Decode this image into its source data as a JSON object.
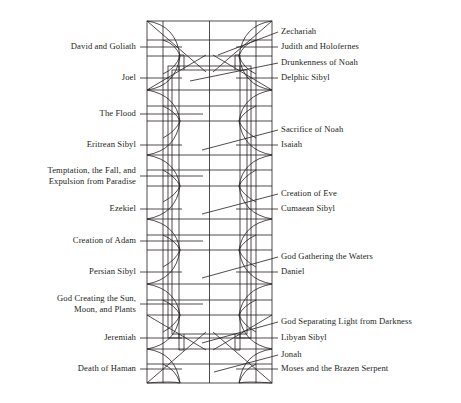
{
  "figure": {
    "type": "architectural-plan-diagram",
    "background_color": "#ffffff",
    "line_color": "#231f20",
    "label_color": "#231f20"
  },
  "labels": {
    "left": [
      {
        "id": "david-and-goliath",
        "text": "David and Goliath",
        "x": 140,
        "y": 47,
        "leader_to_x": 178,
        "leader_to_y": 47,
        "multiline": false
      },
      {
        "id": "joel",
        "text": "Joel",
        "x": 140,
        "y": 78,
        "leader_to_x": 178,
        "leader_to_y": 78,
        "multiline": false
      },
      {
        "id": "the-flood",
        "text": "The Flood",
        "x": 140,
        "y": 114,
        "leader_to_x": 200,
        "leader_to_y": 114,
        "multiline": false
      },
      {
        "id": "eritrean-sibyl",
        "text": "Eritrean Sibyl",
        "x": 140,
        "y": 145,
        "leader_to_x": 178,
        "leader_to_y": 145,
        "multiline": false
      },
      {
        "id": "temptation-fall-expulsion",
        "text": "Temptation, the Fall, and",
        "text2": "Expulsion from Paradise",
        "x": 140,
        "y": 176,
        "leader_to_x": 200,
        "leader_to_y": 176,
        "multiline": true
      },
      {
        "id": "ezekiel",
        "text": "Ezekiel",
        "x": 140,
        "y": 209,
        "leader_to_x": 178,
        "leader_to_y": 209,
        "multiline": false
      },
      {
        "id": "creation-of-adam",
        "text": "Creation of Adam",
        "x": 140,
        "y": 241,
        "leader_to_x": 200,
        "leader_to_y": 241,
        "multiline": false
      },
      {
        "id": "persian-sibyl",
        "text": "Persian Sibyl",
        "x": 140,
        "y": 272,
        "leader_to_x": 178,
        "leader_to_y": 272,
        "multiline": false
      },
      {
        "id": "god-creating-sun-moon-plants",
        "text": "God Creating the Sun,",
        "text2": "Moon, and Plants",
        "x": 140,
        "y": 304,
        "leader_to_x": 200,
        "leader_to_y": 304,
        "multiline": true
      },
      {
        "id": "jeremiah",
        "text": "Jeremiah",
        "x": 140,
        "y": 338,
        "leader_to_x": 178,
        "leader_to_y": 338,
        "multiline": false
      },
      {
        "id": "death-of-haman",
        "text": "Death of Haman",
        "x": 140,
        "y": 369,
        "leader_to_x": 178,
        "leader_to_y": 369,
        "multiline": false
      }
    ],
    "right": [
      {
        "id": "zechariah",
        "text": "Zechariah",
        "x": 280,
        "y": 32,
        "leader_to_x": 243,
        "leader_to_y": 44,
        "multiline": false
      },
      {
        "id": "judith-and-holofernes",
        "text": "Judith and Holofernes",
        "x": 280,
        "y": 47,
        "leader_to_x": 240,
        "leader_to_y": 47,
        "multiline": false
      },
      {
        "id": "drunkenness-of-noah",
        "text": "Drunkenness of Noah",
        "x": 280,
        "y": 63,
        "leader_to_x": 205,
        "leader_to_y": 76,
        "multiline": false
      },
      {
        "id": "delphic-sibyl",
        "text": "Delphic Sibyl",
        "x": 280,
        "y": 78,
        "leader_to_x": 240,
        "leader_to_y": 78,
        "multiline": false
      },
      {
        "id": "sacrifice-of-noah",
        "text": "Sacrifice of Noah",
        "x": 280,
        "y": 130,
        "leader_to_x": 205,
        "leader_to_y": 143,
        "multiline": false
      },
      {
        "id": "isaiah",
        "text": "Isaiah",
        "x": 280,
        "y": 145,
        "leader_to_x": 240,
        "leader_to_y": 145,
        "multiline": false
      },
      {
        "id": "creation-of-eve",
        "text": "Creation of Eve",
        "x": 280,
        "y": 194,
        "leader_to_x": 205,
        "leader_to_y": 207,
        "multiline": false
      },
      {
        "id": "cumaean-sibyl",
        "text": "Cumaean Sibyl",
        "x": 280,
        "y": 209,
        "leader_to_x": 240,
        "leader_to_y": 209,
        "multiline": false
      },
      {
        "id": "god-gathering-the-waters",
        "text": "God Gathering the Waters",
        "x": 280,
        "y": 257,
        "leader_to_x": 205,
        "leader_to_y": 270,
        "multiline": false
      },
      {
        "id": "daniel",
        "text": "Daniel",
        "x": 280,
        "y": 272,
        "leader_to_x": 240,
        "leader_to_y": 272,
        "multiline": false
      },
      {
        "id": "god-separating-light-from-darkness",
        "text": "God Separating Light from Darkness",
        "x": 280,
        "y": 322,
        "leader_to_x": 205,
        "leader_to_y": 335,
        "multiline": false
      },
      {
        "id": "libyan-sibyl",
        "text": "Libyan Sibyl",
        "x": 280,
        "y": 338,
        "leader_to_x": 240,
        "leader_to_y": 338,
        "multiline": false
      },
      {
        "id": "jonah",
        "text": "Jonah",
        "x": 280,
        "y": 355,
        "leader_to_x": 225,
        "leader_to_y": 366,
        "multiline": false
      },
      {
        "id": "moses-and-the-brazen-serpent",
        "text": "Moses and the Brazen Serpent",
        "x": 280,
        "y": 369,
        "leader_to_x": 240,
        "leader_to_y": 369,
        "multiline": false
      }
    ]
  },
  "plan_geometry": {
    "outer_frame": {
      "x": 147,
      "y": 21,
      "width": 125,
      "height": 362
    },
    "center_divider_x": 209.5,
    "inner_panel": {
      "x": 163,
      "y": 67,
      "width": 93,
      "height": 270
    },
    "bay_rows_y": [
      21,
      40,
      56,
      90,
      106,
      121,
      155,
      170,
      186,
      219,
      235,
      250,
      284,
      300,
      315,
      349,
      364,
      383
    ]
  }
}
